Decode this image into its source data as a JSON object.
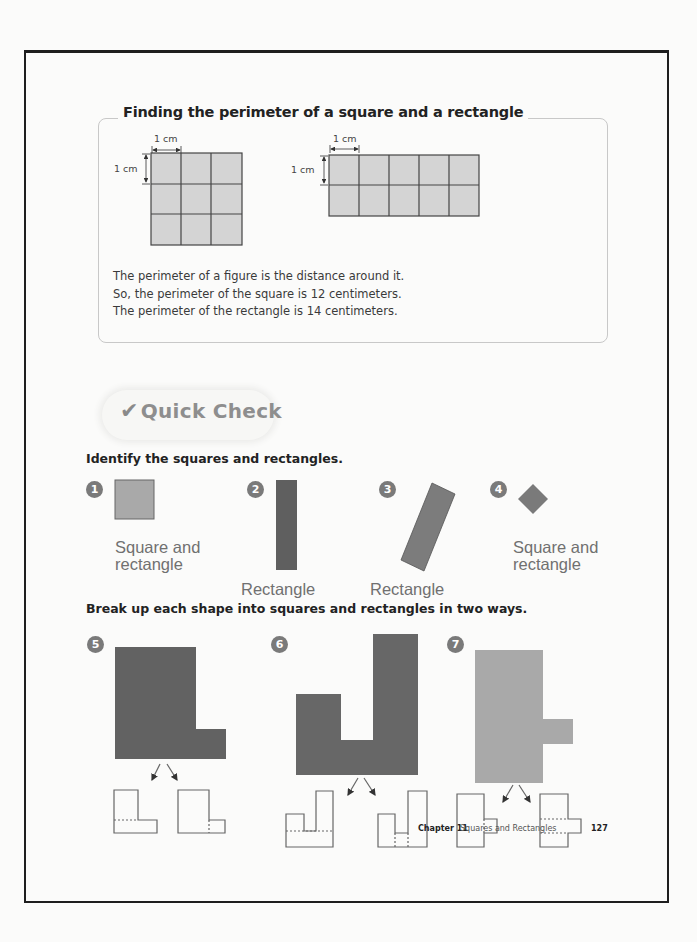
{
  "section": {
    "title": "Finding the perimeter of a square and a rectangle",
    "square_diagram": {
      "unit_width_label": "1 cm",
      "unit_height_label": "1 cm",
      "columns": 3,
      "rows": 3
    },
    "rectangle_diagram": {
      "unit_width_label": "1 cm",
      "unit_height_label": "1 cm",
      "columns": 5,
      "rows": 2
    },
    "description": [
      "The perimeter of a figure is the distance around it.",
      "So, the perimeter of the square is 12 centimeters.",
      "The perimeter of the rectangle is 14 centimeters."
    ]
  },
  "quick_check": {
    "check_icon": "checkmark-icon",
    "check_glyph": "✔",
    "label": "Quick Check"
  },
  "identify": {
    "instruction": "Identify the squares and rectangles.",
    "items": [
      {
        "number": "1",
        "answer_line1": "Square and",
        "answer_line2": "rectangle"
      },
      {
        "number": "2",
        "answer_line1": "Rectangle",
        "answer_line2": ""
      },
      {
        "number": "3",
        "answer_line1": "Rectangle",
        "answer_line2": ""
      },
      {
        "number": "4",
        "answer_line1": "Square and",
        "answer_line2": "rectangle"
      }
    ]
  },
  "break_up": {
    "instruction": "Break up each shape into squares and rectangles in two ways.",
    "items": [
      {
        "number": "5"
      },
      {
        "number": "6"
      },
      {
        "number": "7"
      }
    ]
  },
  "footer": {
    "chapter": "Chapter 11",
    "chapter_title": "Squares and Rectangles",
    "page_number": "127"
  },
  "colors": {
    "grid_fill": "#d4d4d4",
    "light_shape": "#a9a9a9",
    "dark_shape": "#5f5f5f",
    "medium_shape": "#7c7c7c",
    "badge": "#7a7a7a"
  }
}
